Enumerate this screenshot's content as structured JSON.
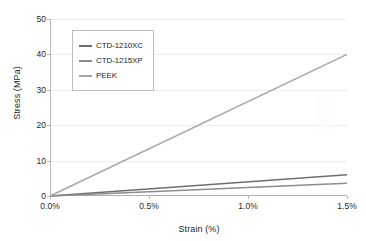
{
  "chart_data": {
    "type": "line",
    "title": "",
    "xlabel": "Strain (%)",
    "ylabel": "Stress (MPa)",
    "xlim": [
      0.0,
      1.5
    ],
    "ylim": [
      0,
      50
    ],
    "x_ticks": [
      "0.0%",
      "0.5%",
      "1.0%",
      "1.5%"
    ],
    "x_tick_values": [
      0.0,
      0.5,
      1.0,
      1.5
    ],
    "y_ticks": [
      "0",
      "10",
      "20",
      "30",
      "40",
      "50"
    ],
    "y_tick_values": [
      0,
      10,
      20,
      30,
      40,
      50
    ],
    "grid": "horizontal",
    "legend_position": "upper-left-inside",
    "x": [
      0.0,
      1.5
    ],
    "series": [
      {
        "name": "CTD-1210XC",
        "color": "#6e6e6e",
        "values": [
          0.0,
          6.0
        ]
      },
      {
        "name": "CTD-1215XP",
        "color": "#8c8c8c",
        "values": [
          0.0,
          3.6
        ]
      },
      {
        "name": "PEEK",
        "color": "#a8a8a8",
        "values": [
          0.0,
          40.0
        ]
      }
    ]
  },
  "legend": {
    "entries": [
      {
        "label": "CTD-1210XC"
      },
      {
        "label": "CTD-1215XP"
      },
      {
        "label": "PEEK"
      }
    ]
  },
  "axes": {
    "y_title": "Stress (MPa)",
    "x_title": "Strain (%)"
  }
}
